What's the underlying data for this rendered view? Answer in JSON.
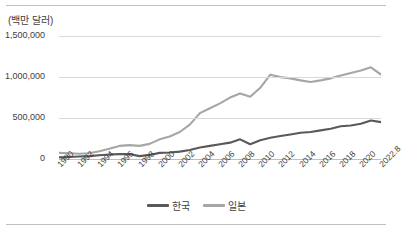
{
  "figure": {
    "title_fragment": "",
    "frame_color": "#bfbfbf"
  },
  "axis": {
    "unit_label": "(백만 달러)",
    "y_ticks": [
      "0",
      "500,000",
      "1,000,000",
      "1,500,000"
    ],
    "x_ticks": [
      "1990",
      "1992",
      "1994",
      "1996",
      "1998",
      "2000",
      "2002",
      "2004",
      "2006",
      "2008",
      "2010",
      "2012",
      "2014",
      "2016",
      "2018",
      "2020",
      "2022.8"
    ]
  },
  "legend": {
    "items": [
      {
        "label": "한국",
        "color": "#595959"
      },
      {
        "label": "일본",
        "color": "#a6a6a6"
      }
    ]
  },
  "chart_data": {
    "type": "line",
    "title": "",
    "subtitle": "",
    "xlabel": "",
    "ylabel": "(백만 달러)",
    "ylim": [
      0,
      1600000
    ],
    "y_ticks": [
      0,
      500000,
      1000000,
      1500000
    ],
    "grid": true,
    "legend_position": "bottom",
    "categories": [
      "1990",
      "1991",
      "1992",
      "1993",
      "1994",
      "1995",
      "1996",
      "1997",
      "1998",
      "1999",
      "2000",
      "2001",
      "2002",
      "2003",
      "2004",
      "2005",
      "2006",
      "2007",
      "2008",
      "2009",
      "2010",
      "2011",
      "2012",
      "2013",
      "2014",
      "2015",
      "2016",
      "2017",
      "2018",
      "2019",
      "2020",
      "2021",
      "2022.8"
    ],
    "series": [
      {
        "name": "한국",
        "color": "#595959",
        "values": [
          20000,
          25000,
          30000,
          35000,
          45000,
          55000,
          60000,
          60000,
          35000,
          50000,
          75000,
          80000,
          90000,
          110000,
          140000,
          160000,
          180000,
          200000,
          240000,
          180000,
          230000,
          260000,
          280000,
          300000,
          320000,
          330000,
          350000,
          370000,
          400000,
          410000,
          430000,
          470000,
          450000
        ]
      },
      {
        "name": "일본",
        "color": "#a6a6a6",
        "values": [
          75000,
          70000,
          65000,
          70000,
          95000,
          125000,
          160000,
          170000,
          160000,
          185000,
          240000,
          275000,
          330000,
          420000,
          560000,
          620000,
          680000,
          750000,
          800000,
          760000,
          870000,
          1030000,
          1000000,
          985000,
          960000,
          940000,
          960000,
          985000,
          1020000,
          1050000,
          1080000,
          1120000,
          1030000
        ]
      }
    ]
  }
}
